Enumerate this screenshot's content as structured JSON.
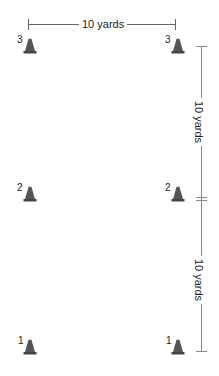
{
  "diagram": {
    "title": "",
    "colors": {
      "line": "#666666",
      "cone": "#555555",
      "cone_shade": "#444444",
      "text": "#222222"
    },
    "horizontal_measure": {
      "label": "10 yards",
      "x1": 28,
      "x2": 176,
      "y": 24
    },
    "vertical_measure": {
      "x": 201,
      "y_top": 46,
      "y_mid": 199,
      "y_bottom": 352,
      "segments": [
        {
          "label": "10 yards",
          "from": "cone row 3",
          "to": "cone row 2"
        },
        {
          "label": "10 yards",
          "from": "cone row 2",
          "to": "cone row 1"
        }
      ]
    },
    "cones": [
      {
        "number": "3",
        "column": "left",
        "x": 23,
        "y": 38
      },
      {
        "number": "3",
        "column": "right",
        "x": 171,
        "y": 38
      },
      {
        "number": "2",
        "column": "left",
        "x": 23,
        "y": 186
      },
      {
        "number": "2",
        "column": "right",
        "x": 171,
        "y": 186
      },
      {
        "number": "1",
        "column": "left",
        "x": 23,
        "y": 339
      },
      {
        "number": "1",
        "column": "right",
        "x": 171,
        "y": 339
      }
    ]
  }
}
